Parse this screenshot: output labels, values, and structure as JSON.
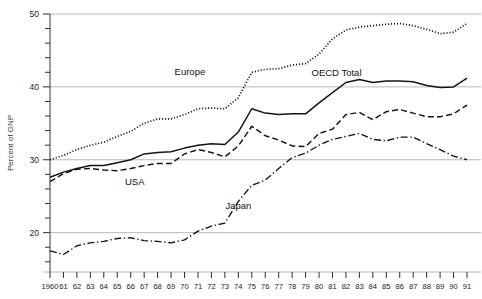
{
  "chart_data": {
    "type": "line",
    "title": "",
    "xlabel": "",
    "ylabel": "Percent of GNP",
    "ylim": [
      14.6,
      50
    ],
    "xlim": [
      1960,
      1991
    ],
    "grid": true,
    "gridlines_at": [
      20,
      30,
      40,
      50
    ],
    "y_major_ticks": [
      20,
      30,
      40,
      50
    ],
    "y_minor_tick_step": 2,
    "legend_position": "inline-annotations",
    "x": [
      1960,
      1961,
      1962,
      1963,
      1964,
      1965,
      1966,
      1967,
      1968,
      1969,
      1970,
      1971,
      1972,
      1973,
      1974,
      1975,
      1976,
      1977,
      1978,
      1979,
      1980,
      1981,
      1982,
      1983,
      1984,
      1985,
      1986,
      1987,
      1988,
      1989,
      1990,
      1991
    ],
    "x_tick_labels": [
      "1960",
      "61",
      "62",
      "63",
      "64",
      "65",
      "66",
      "67",
      "68",
      "69",
      "70",
      "71",
      "72",
      "73",
      "74",
      "75",
      "76",
      "77",
      "78",
      "79",
      "80",
      "81",
      "82",
      "83",
      "84",
      "85",
      "86",
      "87",
      "88",
      "89",
      "90",
      "91"
    ],
    "y_tick_labels": [
      "20",
      "30",
      "40",
      "50"
    ],
    "series": [
      {
        "name": "Europe",
        "style": "dotted",
        "label_x": 1970.4,
        "label_y": 41.6,
        "values": [
          30.0,
          30.6,
          31.4,
          32.0,
          32.4,
          33.2,
          33.9,
          35.0,
          35.6,
          35.6,
          36.2,
          37.0,
          37.1,
          37.0,
          38.5,
          42.0,
          42.4,
          42.5,
          43.0,
          43.2,
          44.5,
          46.6,
          47.8,
          48.2,
          48.4,
          48.6,
          48.7,
          48.4,
          47.9,
          47.3,
          47.5,
          48.7
        ]
      },
      {
        "name": "OECD Total",
        "style": "solid",
        "label_x": 1981.3,
        "label_y": 41.5,
        "values": [
          27.6,
          28.3,
          28.8,
          29.2,
          29.2,
          29.6,
          30.0,
          30.8,
          31.0,
          31.1,
          31.6,
          32.0,
          32.2,
          32.1,
          33.8,
          37.0,
          36.4,
          36.2,
          36.3,
          36.3,
          37.8,
          39.2,
          40.6,
          41.0,
          40.6,
          40.8,
          40.8,
          40.7,
          40.2,
          39.9,
          40.0,
          41.2
        ]
      },
      {
        "name": "USA",
        "style": "dashed",
        "label_x": 1966.3,
        "label_y": 26.5,
        "values": [
          27.0,
          28.1,
          28.7,
          28.8,
          28.6,
          28.5,
          28.8,
          29.2,
          29.5,
          29.5,
          30.8,
          31.4,
          31.0,
          30.4,
          31.9,
          34.6,
          33.3,
          32.7,
          31.9,
          31.8,
          33.6,
          34.2,
          36.2,
          36.5,
          35.5,
          36.6,
          36.9,
          36.4,
          35.9,
          35.9,
          36.3,
          37.5
        ]
      },
      {
        "name": "Japan",
        "style": "dashdot",
        "label_x": 1974.0,
        "label_y": 23.2,
        "values": [
          17.5,
          17.0,
          18.2,
          18.6,
          18.8,
          19.2,
          19.3,
          18.9,
          18.8,
          18.6,
          19.0,
          20.2,
          20.9,
          21.3,
          24.3,
          26.5,
          27.2,
          28.8,
          30.3,
          30.9,
          32.0,
          32.8,
          33.2,
          33.6,
          32.8,
          32.6,
          33.1,
          33.1,
          32.2,
          31.4,
          30.5,
          30.0
        ]
      }
    ]
  }
}
